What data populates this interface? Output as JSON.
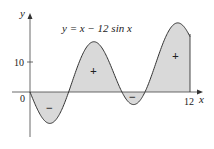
{
  "chart_data": {
    "type": "line",
    "title": "y = x − 12 sin x",
    "function": "y = x - 12 sin x",
    "xlabel": "x",
    "ylabel": "y",
    "x_ticks": [
      {
        "value": 0,
        "label": "0"
      },
      {
        "value": 12,
        "label": "12"
      }
    ],
    "y_ticks": [
      {
        "value": 10,
        "label": "10"
      }
    ],
    "xlim": [
      0,
      12
    ],
    "shaded_regions": [
      {
        "from": 0,
        "to": 2.5,
        "sign": "−"
      },
      {
        "from": 2.5,
        "to": 7.0,
        "sign": "+"
      },
      {
        "from": 7.0,
        "to": 8.5,
        "sign": "−"
      },
      {
        "from": 8.5,
        "to": 12,
        "sign": "+"
      }
    ],
    "grid": false,
    "fill_color": "#d9d9d9",
    "line_color": "#333333"
  },
  "labels": {
    "equation": "y = x − 12 sin x",
    "x_axis": "x",
    "y_axis": "y",
    "origin": "0",
    "x_tick_12": "12",
    "y_tick_10": "10",
    "region1_sign": "−",
    "region2_sign": "+",
    "region3_sign": "−",
    "region4_sign": "+"
  }
}
